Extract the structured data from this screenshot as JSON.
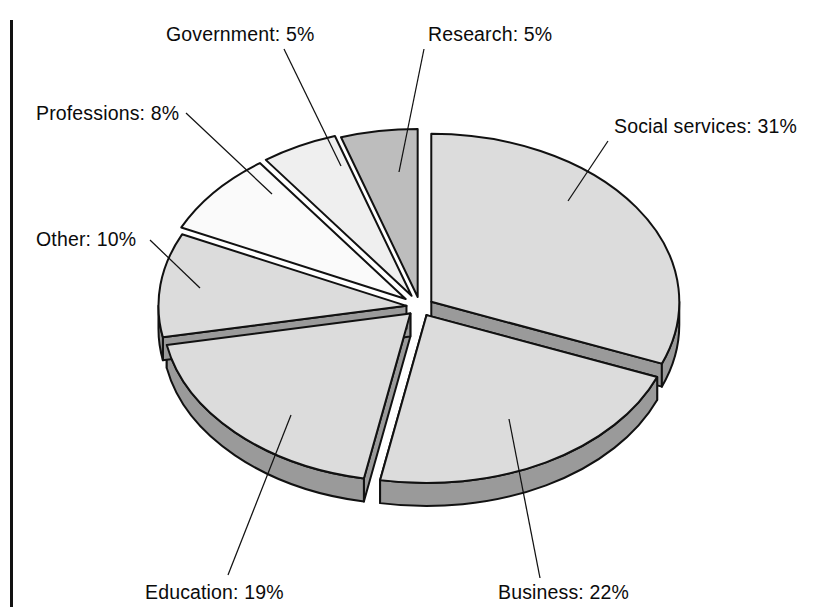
{
  "figure": {
    "kind": "exploded-3d-pie-chart",
    "background_color": "#ffffff",
    "page_rule_color": "#121212",
    "outline_color": "#111111",
    "label_color": "#0b0b0b"
  },
  "labels": {
    "government": "Government:  5%",
    "research": "Research:  5%",
    "professions": "Professions:  8%",
    "social_services": "Social services:  31%",
    "other": "Other:  10%",
    "education": "Education: 19%",
    "business": "Business:  22%"
  },
  "chart_data": {
    "type": "pie",
    "title": "",
    "subtitle": "",
    "xlabel": "",
    "ylabel": "",
    "grid": false,
    "legend_position": "none",
    "labels_inline": true,
    "exploded": true,
    "three_d": true,
    "start_angle_deg": -90,
    "direction": "clockwise",
    "units": "percent",
    "total": 100,
    "categories": [
      "Social services",
      "Business",
      "Education",
      "Other",
      "Professions",
      "Government",
      "Research"
    ],
    "values": [
      31,
      22,
      19,
      10,
      8,
      5,
      5
    ],
    "slices": [
      {
        "name": "Social services",
        "value": 31,
        "label": "Social services:  31%",
        "fill": "#dcdcdc",
        "side_fill": "#9a9a9a",
        "explode": 0.055,
        "start_deg": -90,
        "end_deg": 21.6,
        "label_anchor": "start",
        "label_x": 614,
        "label_y": 133,
        "leader": [
          [
            608,
            141
          ],
          [
            568,
            201
          ]
        ]
      },
      {
        "name": "Business",
        "value": 22,
        "label": "Business:  22%",
        "fill": "#dcdcdc",
        "side_fill": "#9a9a9a",
        "explode": 0.055,
        "start_deg": 21.6,
        "end_deg": 100.8,
        "label_anchor": "start",
        "label_x": 498,
        "label_y": 599,
        "leader": [
          [
            540,
            578
          ],
          [
            509,
            419
          ]
        ]
      },
      {
        "name": "Education",
        "value": 19,
        "label": "Education: 19%",
        "fill": "#dcdcdc",
        "side_fill": "#9a9a9a",
        "explode": 0.055,
        "start_deg": 100.8,
        "end_deg": 169.2,
        "label_anchor": "start",
        "label_x": 145,
        "label_y": 599,
        "leader": [
          [
            228,
            575
          ],
          [
            291,
            415
          ]
        ]
      },
      {
        "name": "Other",
        "value": 10,
        "label": "Other:  10%",
        "fill": "#dcdcdc",
        "side_fill": "#9a9a9a",
        "explode": 0.055,
        "start_deg": 169.2,
        "end_deg": 205.2,
        "label_anchor": "start",
        "label_x": 36,
        "label_y": 246,
        "leader": [
          [
            150,
            240
          ],
          [
            200,
            288
          ]
        ]
      },
      {
        "name": "Professions",
        "value": 8,
        "label": "Professions:  8%",
        "fill": "#fafafa",
        "side_fill": "#cfcfcf",
        "explode": 0.075,
        "start_deg": 205.2,
        "end_deg": 234,
        "label_anchor": "start",
        "label_x": 36,
        "label_y": 120,
        "leader": [
          [
            186,
            113
          ],
          [
            272,
            194
          ]
        ]
      },
      {
        "name": "Government",
        "value": 5,
        "label": "Government:  5%",
        "fill": "#efefef",
        "side_fill": "#c6c6c6",
        "explode": 0.075,
        "start_deg": 234,
        "end_deg": 252,
        "label_anchor": "start",
        "label_x": 166,
        "label_y": 41,
        "leader": [
          [
            284,
            49
          ],
          [
            341,
            166
          ]
        ]
      },
      {
        "name": "Research",
        "value": 5,
        "label": "Research:  5%",
        "fill": "#bdbdbd",
        "side_fill": "#8f8f8f",
        "explode": 0.06,
        "start_deg": 252,
        "end_deg": 270,
        "label_anchor": "start",
        "label_x": 428,
        "label_y": 41,
        "leader": [
          [
            424,
            49
          ],
          [
            399,
            172
          ]
        ]
      }
    ],
    "geometry": {
      "center_x": 420,
      "center_y": 307,
      "radius_x": 248,
      "radius_y": 168,
      "depth": 23
    }
  }
}
